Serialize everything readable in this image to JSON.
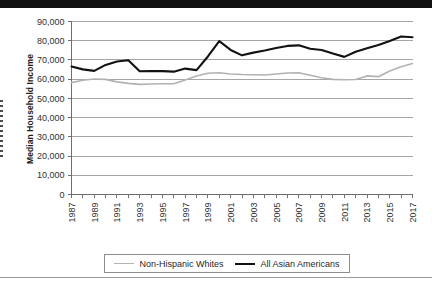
{
  "chart_data": {
    "type": "line",
    "title": "",
    "xlabel": "",
    "ylabel": "Median Household Income",
    "ylim": [
      0,
      90000
    ],
    "ytick_values": [
      0,
      10000,
      20000,
      30000,
      40000,
      50000,
      60000,
      70000,
      80000,
      90000
    ],
    "ytick_labels": [
      "0",
      "10,000",
      "20,000",
      "30,000",
      "40,000",
      "50,000",
      "60,000",
      "70,000",
      "80,000",
      "90,000"
    ],
    "grid": true,
    "legend_position": "bottom",
    "x": [
      1987,
      1988,
      1989,
      1990,
      1991,
      1992,
      1993,
      1994,
      1995,
      1996,
      1997,
      1998,
      1999,
      2000,
      2001,
      2002,
      2003,
      2004,
      2005,
      2006,
      2007,
      2008,
      2009,
      2010,
      2011,
      2012,
      2013,
      2014,
      2015,
      2016,
      2017
    ],
    "xtick_labels": [
      "1987",
      "1989",
      "1991",
      "1993",
      "1995",
      "1997",
      "1999",
      "2001",
      "2003",
      "2005",
      "2007",
      "2009",
      "2011",
      "2013",
      "2015",
      "2017"
    ],
    "xtick_values": [
      1987,
      1989,
      1991,
      1993,
      1995,
      1997,
      1999,
      2001,
      2003,
      2005,
      2007,
      2009,
      2011,
      2013,
      2015,
      2017
    ],
    "series": [
      {
        "name": "Non-Hispanic Whites",
        "color": "#b2b2b2",
        "values": [
          58200,
          59400,
          60100,
          59900,
          58600,
          57800,
          57300,
          57500,
          57600,
          57600,
          59600,
          61600,
          63100,
          63300,
          62700,
          62400,
          62300,
          62200,
          62700,
          63200,
          63300,
          62000,
          60700,
          59900,
          59700,
          59800,
          61700,
          61300,
          64200,
          66500,
          68100
        ]
      },
      {
        "name": "All Asian Americans",
        "color": "#121212",
        "values": [
          66600,
          65100,
          64300,
          67400,
          69200,
          69800,
          64100,
          64200,
          64200,
          63900,
          65500,
          64700,
          71800,
          79800,
          75200,
          72400,
          73800,
          74900,
          76200,
          77300,
          77600,
          75800,
          75200,
          73300,
          71600,
          74300,
          76100,
          77800,
          79900,
          82200,
          81800
        ]
      }
    ]
  },
  "legend": {
    "entries": [
      {
        "label": "Non-Hispanic Whites",
        "swatch": "line-swatch-light"
      },
      {
        "label": "All Asian Americans",
        "swatch": "line-swatch-dark"
      }
    ]
  }
}
